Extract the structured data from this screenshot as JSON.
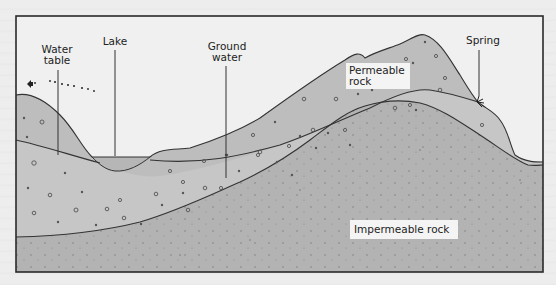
{
  "diagram": {
    "labels": {
      "water_table": "Water\ntable",
      "lake": "Lake",
      "ground_water": "Ground\nwater",
      "permeable_rock": "Permeable\nrock",
      "spring": "Spring",
      "impermeable_rock": "Impermeable rock"
    },
    "layers": [
      {
        "name": "Saturated permeable rock (ground water)",
        "color": "#c9c9c9"
      },
      {
        "name": "Unsaturated permeable rock",
        "color": "#bdbdbd"
      },
      {
        "name": "Impermeable rock",
        "color": "#b0b0b0"
      },
      {
        "name": "Lake water",
        "color": "#b9b9b9"
      }
    ],
    "colors": {
      "background": "#ececec",
      "frame": "#2a2a2a",
      "line": "#333333"
    }
  }
}
